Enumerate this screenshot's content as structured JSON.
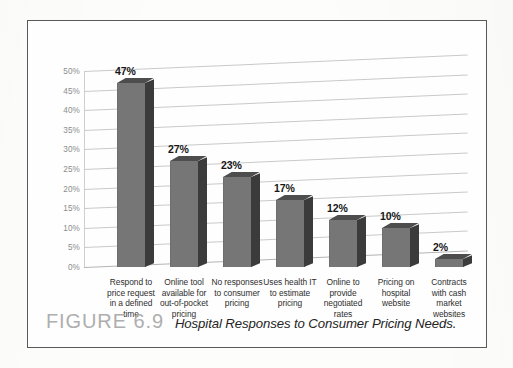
{
  "figure": {
    "number_label": "FIGURE 6.9",
    "title": "Hospital Responses to Consumer Pricing Needs."
  },
  "chart_data": {
    "type": "bar",
    "title": "Hospital Responses to Consumer Pricing Needs.",
    "xlabel": "",
    "ylabel": "",
    "ylim": [
      0,
      50
    ],
    "grid": true,
    "legend": "none",
    "style": "3d-column",
    "categories": [
      "Respond to price request in a defined time",
      "Online tool available for out-of-pocket pricing",
      "No responses to consumer pricing",
      "Uses health IT to estimate pricing",
      "Online to provide negotiated rates",
      "Pricing on hospital website",
      "Contracts with cash market websites"
    ],
    "category_lines": [
      [
        "Respond to",
        "price request",
        "in a defined",
        "time"
      ],
      [
        "Online tool",
        "available for",
        "out-of-pocket",
        "pricing"
      ],
      [
        "No responses",
        "to consumer",
        "pricing"
      ],
      [
        "Uses health IT",
        "to estimate",
        "pricing"
      ],
      [
        "Online to",
        "provide",
        "negotiated",
        "rates"
      ],
      [
        "Pricing on",
        "hospital",
        "website"
      ],
      [
        "Contracts",
        "with cash",
        "market",
        "websites"
      ]
    ],
    "values": [
      47,
      27,
      23,
      17,
      12,
      10,
      2
    ],
    "data_labels": [
      "47%",
      "27%",
      "23%",
      "17%",
      "12%",
      "10%",
      "2%"
    ],
    "ytick_values": [
      50,
      45,
      40,
      35,
      30,
      25,
      20,
      15,
      10,
      5,
      0
    ],
    "ytick_labels": [
      "50%",
      "45%",
      "40%",
      "35%",
      "30%",
      "25%",
      "20%",
      "15%",
      "10%",
      "5%",
      "0%"
    ]
  },
  "colors": {
    "bar_front": "#767676",
    "bar_side": "#3b3b3b",
    "bar_top": "#4d4d4d",
    "gridline": "#c9c9c9",
    "tick_text": "#8c8c8c",
    "caption_figno": "#aeaeae",
    "frame": "#595959"
  }
}
